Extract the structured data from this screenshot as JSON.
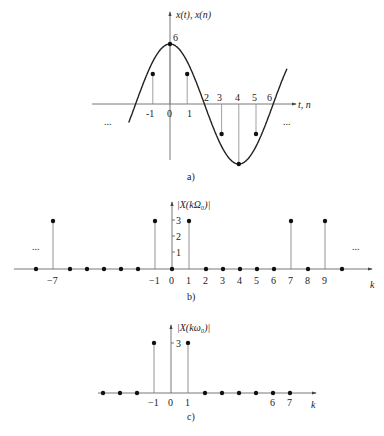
{
  "panels": {
    "a": {
      "caption": "a)",
      "ylabel": "x(t), x(n)",
      "xlabel": "t, n",
      "peak_label": "6",
      "ticks_below": [
        "-1",
        "0",
        "1"
      ],
      "ticks_above": [
        "2",
        "3",
        "4",
        "5",
        "6"
      ],
      "ellipsis_left": "...",
      "ellipsis_right": "...",
      "samples": [
        {
          "n": -1,
          "value": 3
        },
        {
          "n": 0,
          "value": 6
        },
        {
          "n": 1,
          "value": 3
        },
        {
          "n": 3,
          "value": -3
        },
        {
          "n": 4,
          "value": -6
        },
        {
          "n": 5,
          "value": -3
        }
      ]
    },
    "b": {
      "caption": "b)",
      "ylabel": "|X(kΩ₀)|",
      "xlabel": "k",
      "yticks": [
        "3",
        "2",
        "1"
      ],
      "xticks": [
        "-7",
        "-1",
        "0",
        "1",
        "2",
        "3",
        "4",
        "5",
        "6",
        "7",
        "8",
        "9"
      ],
      "ellipsis_left": "...",
      "ellipsis_right": "...",
      "spectrum": [
        {
          "k": -8,
          "value": 0
        },
        {
          "k": -7,
          "value": 3
        },
        {
          "k": -6,
          "value": 0
        },
        {
          "k": -5,
          "value": 0
        },
        {
          "k": -4,
          "value": 0
        },
        {
          "k": -3,
          "value": 0
        },
        {
          "k": -2,
          "value": 0
        },
        {
          "k": -1,
          "value": 3
        },
        {
          "k": 0,
          "value": 0
        },
        {
          "k": 1,
          "value": 3
        },
        {
          "k": 2,
          "value": 0
        },
        {
          "k": 3,
          "value": 0
        },
        {
          "k": 4,
          "value": 0
        },
        {
          "k": 5,
          "value": 0
        },
        {
          "k": 6,
          "value": 0
        },
        {
          "k": 7,
          "value": 3
        },
        {
          "k": 8,
          "value": 0
        },
        {
          "k": 9,
          "value": 3
        },
        {
          "k": 10,
          "value": 0
        }
      ]
    },
    "c": {
      "caption": "c)",
      "ylabel": "|X(kω₀)|",
      "xlabel": "k",
      "ytick": "3",
      "xticks": [
        "-1",
        "0",
        "1",
        "6",
        "7"
      ],
      "spectrum": [
        {
          "k": -4,
          "value": 0
        },
        {
          "k": -3,
          "value": 0
        },
        {
          "k": -2,
          "value": 0
        },
        {
          "k": -1,
          "value": 3
        },
        {
          "k": 1,
          "value": 3
        },
        {
          "k": 2,
          "value": 0
        },
        {
          "k": 3,
          "value": 0
        },
        {
          "k": 4,
          "value": 0
        },
        {
          "k": 5,
          "value": 0
        },
        {
          "k": 6,
          "value": 0
        },
        {
          "k": 7,
          "value": 0
        }
      ]
    }
  }
}
